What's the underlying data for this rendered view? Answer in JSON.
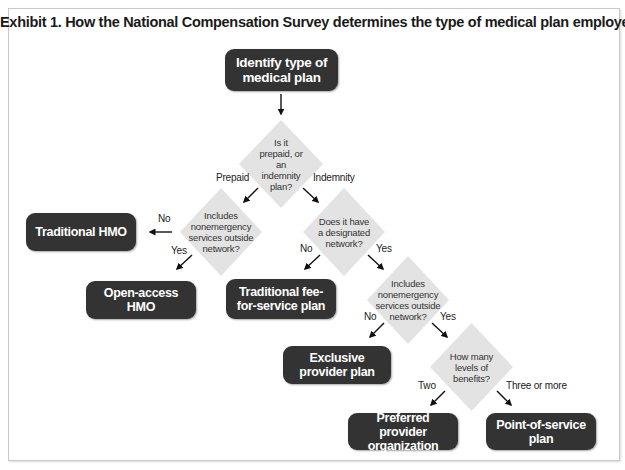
{
  "title": "Exhibit 1. How the National Compensation Survey determines the type of medical plan employers offer",
  "colors": {
    "box_fill": "#333333",
    "box_text": "#ffffff",
    "diamond_fill": "#e3e3e3",
    "diamond_text": "#333333",
    "frame_border": "#c9c9c9"
  },
  "nodes": {
    "start": {
      "label": "Identify type of medical plan"
    },
    "q_prepaid_or_indemnity": {
      "label": "Is it prepaid, or an indemnity plan?"
    },
    "q_hmo_outside_network": {
      "label": "Includes nonemergency services outside network?"
    },
    "q_designated_network": {
      "label": "Does it have a designated network?"
    },
    "q_ppo_outside_network": {
      "label": "Includes nonemergency services outside network?"
    },
    "q_levels_of_benefits": {
      "label": "How many levels of benefits?"
    },
    "traditional_hmo": {
      "label": "Traditional HMO"
    },
    "open_access_hmo": {
      "label": "Open-access HMO"
    },
    "traditional_fee_for_service": {
      "label": "Traditional fee-for-service plan"
    },
    "exclusive_provider_plan": {
      "label": "Exclusive provider plan"
    },
    "preferred_provider_organization": {
      "label": "Preferred provider organization"
    },
    "point_of_service_plan": {
      "label": "Point-of-service plan"
    }
  },
  "edges": {
    "start_to_q1": {
      "label": ""
    },
    "prepaid": {
      "label": "Prepaid"
    },
    "indemnity": {
      "label": "Indemnity"
    },
    "hmo_no": {
      "label": "No"
    },
    "hmo_yes": {
      "label": "Yes"
    },
    "network_no": {
      "label": "No"
    },
    "network_yes": {
      "label": "Yes"
    },
    "outside_no": {
      "label": "No"
    },
    "outside_yes": {
      "label": "Yes"
    },
    "levels_two": {
      "label": "Two"
    },
    "levels_three_or_more": {
      "label": "Three or more"
    }
  }
}
